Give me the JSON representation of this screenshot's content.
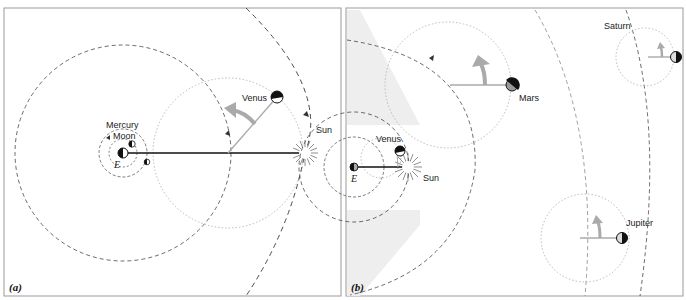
{
  "panels": [
    {
      "id": "a",
      "label": "(a)",
      "bodies": {
        "earth": "E",
        "moon": "Moon",
        "mercury": "Mercury",
        "venus": "Venus",
        "sun": "Sun"
      }
    },
    {
      "id": "b",
      "label": "(b)",
      "bodies": {
        "earth": "E",
        "venus": "Venus",
        "sun": "Sun",
        "mars": "Mars",
        "jupiter": "Jupiter",
        "saturn": "Saturn"
      }
    }
  ],
  "colors": {
    "frame": "#999999",
    "orbit_dashed": "#333333",
    "epicycle_dotted": "#aaaaaa",
    "arrow": "#aaaaaa",
    "shade": "#eeeeee"
  }
}
